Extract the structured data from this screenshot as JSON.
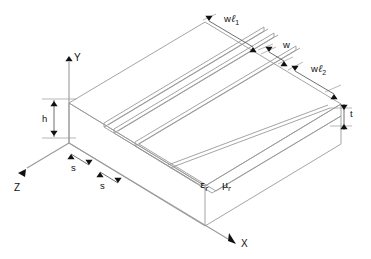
{
  "figure": {
    "type": "engineering-diagram",
    "background_color": "#ffffff",
    "line_color": "#9a9a9a",
    "label_color": "#111111"
  },
  "axes": [
    {
      "name": "y-axis",
      "label": "Y",
      "direction": "up"
    },
    {
      "name": "x-axis",
      "label": "X",
      "direction": "down-right"
    },
    {
      "name": "z-axis",
      "label": "Z",
      "direction": "down-left"
    }
  ],
  "dimensions": [
    {
      "name": "strip-width-1",
      "label": "w",
      "subscript": "",
      "script": "ℓ",
      "sub": "1",
      "full": "wℓ1",
      "orientation": "diagonal"
    },
    {
      "name": "gap-width",
      "label": "w",
      "subscript": "",
      "script": "",
      "sub": "",
      "full": "w",
      "orientation": "diagonal"
    },
    {
      "name": "strip-width-2",
      "label": "w",
      "subscript": "",
      "script": "ℓ",
      "sub": "2",
      "full": "wℓ2",
      "orientation": "diagonal"
    },
    {
      "name": "strip-thickness",
      "label": "t",
      "full": "t",
      "orientation": "vertical"
    },
    {
      "name": "substrate-height",
      "label": "h",
      "full": "h",
      "orientation": "vertical"
    },
    {
      "name": "spacing-1",
      "label": "s",
      "full": "s",
      "orientation": "diagonal"
    },
    {
      "name": "spacing-2",
      "label": "s",
      "full": "s",
      "orientation": "diagonal"
    }
  ],
  "material": {
    "name": "substrate-material-properties",
    "permittivity_symbol": "ε",
    "permittivity_subscript": "r",
    "permeability_symbol": "μ",
    "permeability_subscript": "r",
    "full": "εr μr"
  },
  "labels": {
    "wl1": "w",
    "wl1_script": "ℓ",
    "wl1_sub": "1",
    "w": "w",
    "wl2": "w",
    "wl2_script": "ℓ",
    "wl2_sub": "2",
    "t": "t",
    "h": "h",
    "s1": "s",
    "s2": "s",
    "axis_x": "X",
    "axis_y": "Y",
    "axis_z": "Z",
    "eps": "ε",
    "eps_sub": "r",
    "mu": "μ",
    "mu_sub": "r"
  }
}
